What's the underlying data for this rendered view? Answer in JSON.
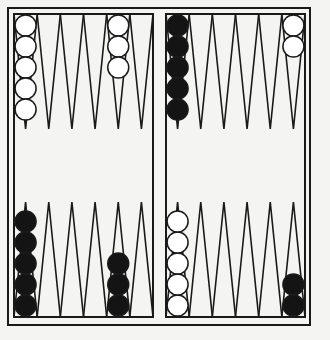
{
  "board": {
    "name": "backgammon-board",
    "colors": {
      "background": "#f4f4f2",
      "line": "#1a1a1a",
      "white_checker": "#ffffff",
      "black_checker": "#141414"
    },
    "outer": {
      "x": 8,
      "y": 8,
      "w": 302,
      "h": 317
    },
    "halves": [
      {
        "side": "left",
        "x": 14,
        "y": 14,
        "w": 139,
        "h": 303
      },
      {
        "side": "right",
        "x": 166,
        "y": 14,
        "w": 139,
        "h": 303
      }
    ]
  },
  "points": {
    "top_left": [
      {
        "index": 0,
        "color": "white",
        "count": 5
      },
      {
        "index": 1,
        "color": null,
        "count": 0
      },
      {
        "index": 2,
        "color": null,
        "count": 0
      },
      {
        "index": 3,
        "color": null,
        "count": 0
      },
      {
        "index": 4,
        "color": "white",
        "count": 3
      },
      {
        "index": 5,
        "color": null,
        "count": 0
      }
    ],
    "top_right": [
      {
        "index": 0,
        "color": "black",
        "count": 5
      },
      {
        "index": 1,
        "color": null,
        "count": 0
      },
      {
        "index": 2,
        "color": null,
        "count": 0
      },
      {
        "index": 3,
        "color": null,
        "count": 0
      },
      {
        "index": 4,
        "color": null,
        "count": 0
      },
      {
        "index": 5,
        "color": "white",
        "count": 2
      }
    ],
    "bottom_left": [
      {
        "index": 0,
        "color": "black",
        "count": 5
      },
      {
        "index": 1,
        "color": null,
        "count": 0
      },
      {
        "index": 2,
        "color": null,
        "count": 0
      },
      {
        "index": 3,
        "color": null,
        "count": 0
      },
      {
        "index": 4,
        "color": "black",
        "count": 3
      },
      {
        "index": 5,
        "color": null,
        "count": 0
      }
    ],
    "bottom_right": [
      {
        "index": 0,
        "color": "white",
        "count": 5
      },
      {
        "index": 1,
        "color": null,
        "count": 0
      },
      {
        "index": 2,
        "color": null,
        "count": 0
      },
      {
        "index": 3,
        "color": null,
        "count": 0
      },
      {
        "index": 4,
        "color": null,
        "count": 0
      },
      {
        "index": 5,
        "color": "black",
        "count": 2
      }
    ]
  }
}
